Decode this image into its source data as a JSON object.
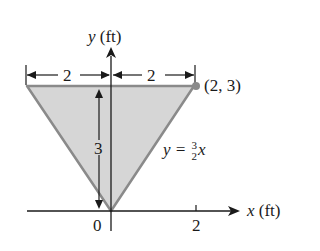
{
  "diagram": {
    "type": "geometry-figure",
    "colors": {
      "fill": "#d6d6d6",
      "edge": "#8a8a8a",
      "axis": "#1a1a1a",
      "point": "#8a8a8a"
    },
    "axes": {
      "x_label_var": "x",
      "x_label_unit": "(ft)",
      "y_label_var": "y",
      "y_label_unit": "(ft)",
      "x_ticks": [
        "0",
        "2"
      ]
    },
    "dimensions": {
      "left_width": "2",
      "right_width": "2",
      "height": "3"
    },
    "point_label": "(2, 3)",
    "equation": {
      "lhs": "y =",
      "num": "3",
      "den": "2",
      "var": "x"
    }
  }
}
